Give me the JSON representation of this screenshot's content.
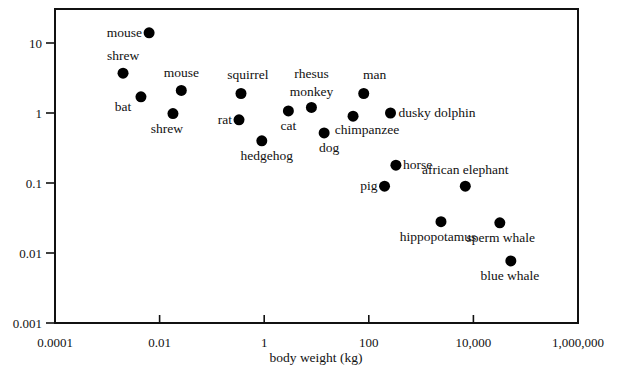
{
  "chart_data": {
    "type": "scatter",
    "title": "",
    "xlabel": "body weight (kg)",
    "ylabel": "",
    "xscale": "log",
    "yscale": "log",
    "xlim": [
      0.0001,
      1000000
    ],
    "ylim": [
      0.001,
      30
    ],
    "grid": false,
    "legend": null,
    "x_ticks": [
      {
        "value": 0.0001,
        "label": "0.0001"
      },
      {
        "value": 0.01,
        "label": "0.01"
      },
      {
        "value": 1,
        "label": "1"
      },
      {
        "value": 100,
        "label": "100"
      },
      {
        "value": 10000,
        "label": "10,000"
      },
      {
        "value": 1000000,
        "label": "1,000,000"
      }
    ],
    "y_ticks": [
      {
        "value": 10,
        "label": "10"
      },
      {
        "value": 1,
        "label": "1"
      },
      {
        "value": 0.1,
        "label": "0.1"
      },
      {
        "value": 0.01,
        "label": "0.01"
      },
      {
        "value": 0.001,
        "label": "0.001"
      }
    ],
    "points": [
      {
        "label": "mouse",
        "x": 0.0063,
        "y": 14,
        "lx": -7,
        "ly": 4,
        "anchor": "end"
      },
      {
        "label": "shrew",
        "x": 0.002,
        "y": 3.7,
        "lx": 0,
        "ly": -13,
        "anchor": "middle"
      },
      {
        "label": "mouse",
        "x": 0.026,
        "y": 2.1,
        "lx": 0,
        "ly": -13,
        "anchor": "middle"
      },
      {
        "label": "bat",
        "x": 0.0044,
        "y": 1.7,
        "lx": -18,
        "ly": 14,
        "anchor": "middle"
      },
      {
        "label": "shrew",
        "x": 0.018,
        "y": 0.98,
        "lx": -6,
        "ly": 19,
        "anchor": "middle"
      },
      {
        "label": "squirrel",
        "x": 0.36,
        "y": 1.9,
        "lx": 7,
        "ly": -14,
        "anchor": "middle"
      },
      {
        "label": "rat",
        "x": 0.33,
        "y": 0.8,
        "lx": -7,
        "ly": 4,
        "anchor": "end"
      },
      {
        "label": "cat",
        "x": 2.9,
        "y": 1.07,
        "lx": 0,
        "ly": 19,
        "anchor": "middle"
      },
      {
        "label": "rhesus",
        "x": 8,
        "y": 1.2,
        "lx": 0,
        "ly": -29,
        "anchor": "middle"
      },
      {
        "label": "monkey",
        "x": null,
        "y": null,
        "lx": 0,
        "ly": -11,
        "anchor": "middle",
        "continuation_of": 8
      },
      {
        "label": "hedgehog",
        "x": 0.9,
        "y": 0.4,
        "lx": 5,
        "ly": 19,
        "anchor": "middle"
      },
      {
        "label": "dog",
        "x": 14,
        "y": 0.52,
        "lx": 5,
        "ly": 19,
        "anchor": "middle"
      },
      {
        "label": "chimpanzee",
        "x": 50,
        "y": 0.9,
        "lx": 14,
        "ly": 18,
        "anchor": "middle"
      },
      {
        "label": "man",
        "x": 80,
        "y": 1.9,
        "lx": 11,
        "ly": -14,
        "anchor": "middle"
      },
      {
        "label": "dusky dolphin",
        "x": 260,
        "y": 1.0,
        "lx": 8,
        "ly": 4,
        "anchor": "start"
      },
      {
        "label": "horse",
        "x": 330,
        "y": 0.18,
        "lx": 7,
        "ly": 4,
        "anchor": "start"
      },
      {
        "label": "pig",
        "x": 200,
        "y": 0.09,
        "lx": -7,
        "ly": 4,
        "anchor": "end"
      },
      {
        "label": "african elephant",
        "x": 7000,
        "y": 0.09,
        "lx": 0,
        "ly": -12,
        "anchor": "middle"
      },
      {
        "label": "hippopotamus",
        "x": 2400,
        "y": 0.028,
        "lx": -3,
        "ly": 19,
        "anchor": "middle"
      },
      {
        "label": "sperm whale",
        "x": 32000,
        "y": 0.027,
        "lx": 1,
        "ly": 19,
        "anchor": "middle"
      },
      {
        "label": "blue whale",
        "x": 52000,
        "y": 0.0077,
        "lx": -1,
        "ly": 19,
        "anchor": "middle"
      }
    ]
  },
  "layout": {
    "plot_left": 55,
    "plot_right": 578,
    "plot_top": 9,
    "plot_bottom": 323,
    "x_px_per_decade": 52.3,
    "x_origin_log": -4,
    "y_px_at_10": 43,
    "y_px_per_decade": 70
  }
}
